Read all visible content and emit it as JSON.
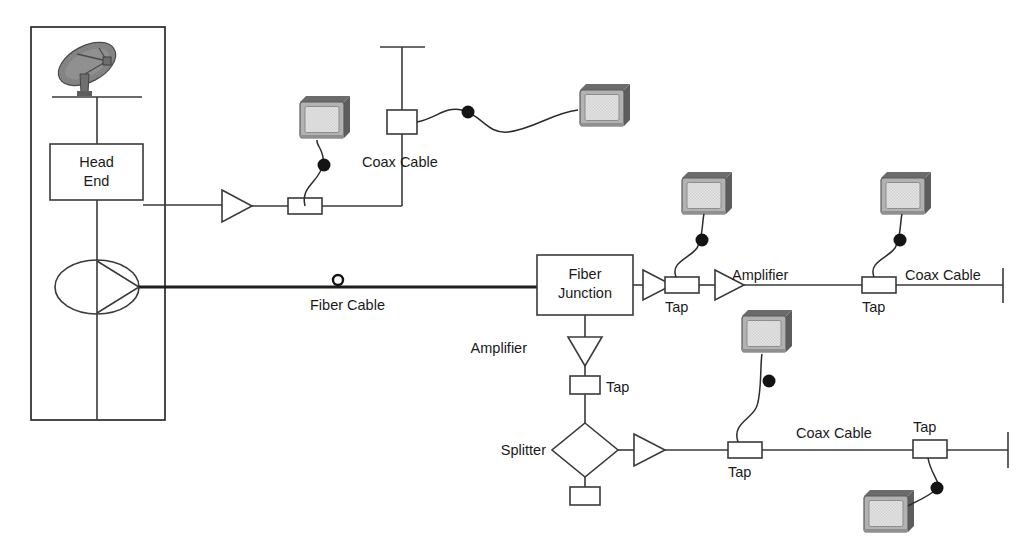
{
  "diagram": {
    "colors": {
      "background": "#ffffff",
      "line": "#3a3a3a",
      "fiber_line": "#1e1e1e",
      "text": "#1a1a1a",
      "tv_body": "#b4b4b4",
      "tv_screen": "#e2e2e2",
      "tv_shade": "#6e6e6e",
      "dish": "#8a8a8a",
      "connector": "#141414"
    },
    "headend": {
      "label_line1": "Head",
      "label_line2": "End",
      "dish_name": "satellite-dish-icon",
      "transmitter_name": "optical-transmitter-symbol"
    },
    "labels": {
      "coax_cable_top": "Coax Cable",
      "coax_cable_mid_right": "Coax Cable",
      "coax_cable_bottom": "Coax Cable",
      "fiber_cable": "Fiber Cable",
      "fiber_junction_line1": "Fiber",
      "fiber_junction_line2": "Junction",
      "amplifier_mid": "Amplifier",
      "amplifier_branch": "Amplifier",
      "splitter": "Splitter",
      "tap_branch": "Tap",
      "tap_mid_1": "Tap",
      "tap_mid_2": "Tap",
      "tap_bottom_1": "Tap",
      "tap_bottom_2": "Tap"
    },
    "components": {
      "taps": [
        {
          "id": "tap-headend-drop",
          "label": "",
          "orientation": "horizontal"
        },
        {
          "id": "tap-coax-vertical",
          "label": "",
          "orientation": "vertical"
        },
        {
          "id": "tap-mid-1",
          "label": "Tap",
          "orientation": "horizontal"
        },
        {
          "id": "tap-mid-2",
          "label": "Tap",
          "orientation": "horizontal"
        },
        {
          "id": "tap-branch",
          "label": "Tap",
          "orientation": "vertical"
        },
        {
          "id": "tap-bottom-1",
          "label": "Tap",
          "orientation": "horizontal"
        },
        {
          "id": "tap-bottom-2",
          "label": "Tap",
          "orientation": "horizontal"
        },
        {
          "id": "terminator-box-splitter",
          "label": "",
          "orientation": "vertical"
        }
      ],
      "amplifiers": [
        {
          "id": "amplifier-headend",
          "label": "",
          "direction": "right"
        },
        {
          "id": "amplifier-mid-1",
          "label": "",
          "direction": "right"
        },
        {
          "id": "amplifier-mid-2",
          "label": "Amplifier",
          "direction": "right"
        },
        {
          "id": "amplifier-branch",
          "label": "Amplifier",
          "direction": "down"
        },
        {
          "id": "amplifier-bottom",
          "label": "",
          "direction": "right"
        }
      ],
      "televisions": [
        {
          "id": "tv-upper-left",
          "connects_to": "tap-headend-drop"
        },
        {
          "id": "tv-upper-right",
          "connects_to": "tap-coax-vertical"
        },
        {
          "id": "tv-mid-1",
          "connects_to": "tap-mid-1"
        },
        {
          "id": "tv-mid-2",
          "connects_to": "tap-mid-2"
        },
        {
          "id": "tv-bottom-1",
          "connects_to": "tap-bottom-1"
        },
        {
          "id": "tv-bottom-2",
          "connects_to": "tap-bottom-2"
        }
      ],
      "splitter": {
        "id": "splitter-diamond",
        "label": "Splitter",
        "ports": 3
      },
      "fiber_junction": {
        "id": "fiber-junction-box",
        "label": "Fiber Junction"
      },
      "terminators": [
        {
          "id": "terminator-coax-top"
        },
        {
          "id": "terminator-mid-right"
        },
        {
          "id": "terminator-bottom-right"
        }
      ]
    }
  }
}
